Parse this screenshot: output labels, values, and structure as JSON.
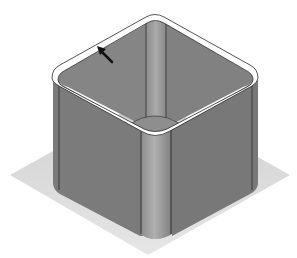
{
  "figure": {
    "description": "Isometric 3D render of an open square box with rounded vertical corner edges standing on a light gray square base plate; a black arrow points at the top rim edge.",
    "colors": {
      "background": "#ffffff",
      "plate": "#d9d9d9",
      "wall": "#7d7d7d",
      "wall_dark": "#5e5e5e",
      "inner_wall": "#858585",
      "column": "#a3a3a3",
      "rim": "#ffffff",
      "edge_line": "#2a2a2a",
      "arrow": "#111111"
    },
    "annotations": [
      {
        "type": "arrow",
        "target": "top-rim-edge"
      }
    ]
  }
}
